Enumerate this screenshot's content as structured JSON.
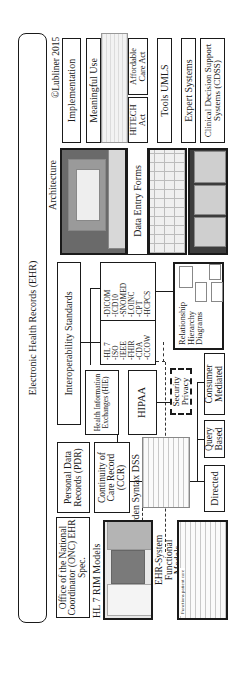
{
  "title": "Electronic Health Records (EHR)",
  "copyright": "©Lubliner 2015",
  "right_column": {
    "implementation": "Implementation",
    "meaningful_use": "Meaningful Use",
    "hitech": "HITECH Act",
    "aca": "Affordable Care Act",
    "tools_umls": "Tools UMLS",
    "expert_systems": "Expert Systems",
    "cdss": "Clinical Decision Support Systems (CDSS)"
  },
  "architecture": {
    "label": "Architecture",
    "data_entry_forms": "Data Entry Forms"
  },
  "interoperability": {
    "title": "Interoperability Standards",
    "group1": [
      "-DICOM",
      "-ICD10",
      "-SNOMED",
      "-LOINC",
      "-CPT",
      "-HCPCS"
    ],
    "group2": [
      "-HL 7",
      "-ISO",
      "-IEEE",
      "-FHIR",
      "-CDA",
      "-CCOW"
    ],
    "relationship": "Relationship Hierarchy Diagrams"
  },
  "exchange": {
    "hie": "Health Information Exchanges (HIE)",
    "hipaa": "HIPAA",
    "security_privacy": "Security Privacy",
    "consumer_mediated": "Consumer Mediated",
    "query_based": "Query Based",
    "directed": "Directed"
  },
  "records": {
    "pdr": "Personal Data Records (PDR)",
    "ccr": "Continuity of Care Record (CCR)",
    "arden": "Arden Syntax DSS",
    "onc": "Office of the National Coordinator (ONC) EHR Spec.",
    "hl7_rim": "HL 7 RIM Models",
    "ehr_functional": "EHR-System Functional Models",
    "functions_caption": "Functions patient care"
  }
}
